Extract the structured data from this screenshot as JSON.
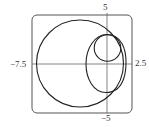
{
  "figure": {
    "type": "polar curves plot",
    "frame": {
      "stroke": "#555555",
      "corner_radius": 5
    },
    "axes": {
      "x_range": [
        -7.5,
        2.5
      ],
      "y_range": [
        -5,
        5
      ],
      "labels": {
        "x_min": "−7.5",
        "x_max": "2.5",
        "y_max": "5",
        "y_min": "−5"
      }
    },
    "curves": [
      {
        "name": "large-circle",
        "cx": -2.7,
        "cy": 0.05,
        "r": 4.35
      },
      {
        "name": "small-circle",
        "cx": 0.0,
        "cy": 1.6,
        "r": 1.3
      },
      {
        "name": "egg-curve",
        "x_min": -2.1,
        "x_max": 1.9,
        "y_min": -2.8,
        "y_max": 3.0
      }
    ],
    "stroke_color": "#222222"
  }
}
